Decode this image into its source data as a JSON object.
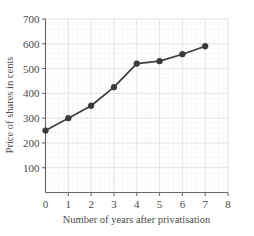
{
  "chart_data": {
    "type": "line",
    "title": "",
    "subtitle": "",
    "xlabel": "Number of years after privatisation",
    "ylabel": "Price of shares in cents",
    "x": [
      0,
      1,
      2,
      3,
      4,
      5,
      6,
      7
    ],
    "values": [
      250,
      300,
      350,
      425,
      520,
      530,
      558,
      590
    ],
    "series": [
      {
        "name": "Price of shares",
        "values": [
          250,
          300,
          350,
          425,
          520,
          530,
          558,
          590
        ]
      }
    ],
    "xlim": [
      0,
      8
    ],
    "ylim": [
      0,
      700
    ],
    "x_ticks": [
      0,
      1,
      2,
      3,
      4,
      5,
      6,
      7,
      8
    ],
    "x_tick_labels": [
      "0",
      "1",
      "2",
      "3",
      "4",
      "5",
      "6",
      "7",
      "8"
    ],
    "y_ticks": [
      0,
      100,
      200,
      300,
      400,
      500,
      600,
      700
    ],
    "y_tick_labels": [
      "",
      "100",
      "200",
      "300",
      "400",
      "500",
      "600",
      "700"
    ],
    "grid": true,
    "minor_grid": true,
    "legend": "none",
    "marker": "circle",
    "line_color": "#3a3a3a",
    "marker_color": "#3a3a3a",
    "grid_color": "#d7dce2",
    "minor_grid_color": "#edf0f3",
    "axis_color": "#6b6b6b",
    "background_color": "#ffffff"
  }
}
